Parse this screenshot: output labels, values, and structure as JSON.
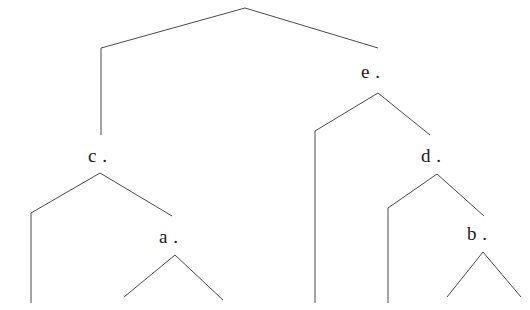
{
  "figure": {
    "kind": "binary-tree-diagram",
    "width": 530,
    "height": 310,
    "background_color": "#ffffff",
    "line_color": "#4a4a4a",
    "text_color": "#1a1a1a"
  },
  "labels": {
    "c": "c .",
    "e": "e .",
    "a": "a .",
    "d": "d .",
    "b": "b ."
  },
  "nodes": [
    {
      "id": "root",
      "label": "",
      "apex_x": 245,
      "apex_y": 8
    },
    {
      "id": "c",
      "label": "c .",
      "apex_x": 100,
      "apex_y": 173,
      "label_x": 88,
      "label_y": 146
    },
    {
      "id": "e",
      "label": "e .",
      "apex_x": 378,
      "apex_y": 93,
      "label_x": 361,
      "label_y": 62
    },
    {
      "id": "a",
      "label": "a .",
      "apex_x": 175,
      "apex_y": 255,
      "label_x": 159,
      "label_y": 227
    },
    {
      "id": "d",
      "label": "d .",
      "apex_x": 437,
      "apex_y": 174,
      "label_x": 421,
      "label_y": 146
    },
    {
      "id": "b",
      "label": "b .",
      "apex_x": 483,
      "apex_y": 252,
      "label_x": 467,
      "label_y": 224
    }
  ],
  "edges": [
    {
      "id": "root-left",
      "points": "245,8 101,48 101,135"
    },
    {
      "id": "root-right",
      "points": "245,8 378,48"
    },
    {
      "id": "c-left",
      "points": "100,173 31,213 31,303"
    },
    {
      "id": "c-right",
      "points": "100,173 172,216"
    },
    {
      "id": "a-left",
      "points": "175,255 124,297"
    },
    {
      "id": "a-right",
      "points": "175,255 223,300"
    },
    {
      "id": "e-left",
      "points": "378,93 315,131 315,303"
    },
    {
      "id": "e-right",
      "points": "378,93 430,135"
    },
    {
      "id": "d-left",
      "points": "437,174 388,208 388,303"
    },
    {
      "id": "d-right",
      "points": "437,174 484,216"
    },
    {
      "id": "b-left",
      "points": "483,252 447,297"
    },
    {
      "id": "b-right",
      "points": "483,252 521,297"
    }
  ]
}
